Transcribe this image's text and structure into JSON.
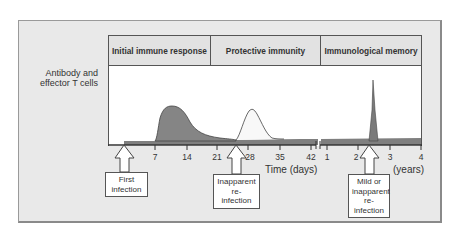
{
  "diagram": {
    "y_axis_label_line1": "Antibody and",
    "y_axis_label_line2": "effector T cells",
    "phases": [
      {
        "label": "Initial immune response"
      },
      {
        "label": "Protective immunity"
      },
      {
        "label": "Immunological memory"
      }
    ],
    "x_axis_title_days": "Time  (days)",
    "x_axis_title_years": "(years)",
    "ticks_days": [
      "7",
      "14",
      "21",
      "28",
      "35",
      "42"
    ],
    "ticks_years": [
      "1",
      "2",
      "3",
      "4"
    ],
    "callouts": [
      {
        "line1": "First",
        "line2": "infection"
      },
      {
        "line1": "Inapparent",
        "line2": "re-infection"
      },
      {
        "line1": "Mild  or",
        "line2": "inapparent",
        "line3": "re-infection"
      }
    ],
    "colors": {
      "panel_bg": "#e9e9e9",
      "header_bg": "#e2e2e2",
      "primary_response_fill": "#858585",
      "secondary_response_fill": "#f8f8f8",
      "memory_spike_fill": "#7a7a7a",
      "baseline_fill": "#7f7f7f"
    }
  }
}
